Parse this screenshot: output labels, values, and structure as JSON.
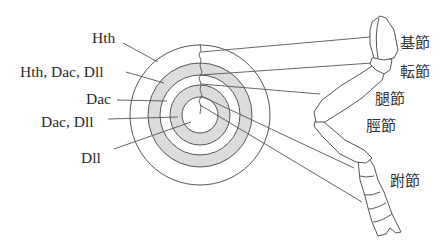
{
  "diagram": {
    "type": "gene-expression-to-leg-segment-map",
    "colors": {
      "shaded_ring": "#dcdcdc",
      "line": "#555555",
      "text": "#2a2a2a",
      "background": "#ffffff"
    },
    "disc_labels": [
      {
        "id": "hth",
        "text": "Hth"
      },
      {
        "id": "hth-dac-dll",
        "text": "Hth, Dac, Dll"
      },
      {
        "id": "dac",
        "text": "Dac"
      },
      {
        "id": "dac-dll",
        "text": "Dac, Dll"
      },
      {
        "id": "dll",
        "text": "Dll"
      }
    ],
    "leg_segments": [
      {
        "id": "coxa",
        "text": "基節"
      },
      {
        "id": "trochanter",
        "text": "転節"
      },
      {
        "id": "femur",
        "text": "腿節"
      },
      {
        "id": "tibia",
        "text": "脛節"
      },
      {
        "id": "tarsus",
        "text": "跗節"
      }
    ]
  }
}
